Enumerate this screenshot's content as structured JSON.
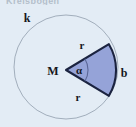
{
  "figure": {
    "cut_off_caption": "Kreisbogen",
    "background_color": "#e3ecf5",
    "circle": {
      "label": "k",
      "center_x": 66,
      "center_y": 67,
      "radius": 52,
      "stroke_color": "#9aa6b4",
      "fill": "none"
    },
    "sector": {
      "fill_color": "#95a3d8",
      "stroke_color": "#1b2340",
      "apex_x": 66,
      "apex_y": 70,
      "radius": 50,
      "start_angle_deg": -31,
      "end_angle_deg": 31
    },
    "inner_arc": {
      "radius": 22,
      "stroke_color": "#5b6797"
    },
    "labels": {
      "circle": "k",
      "center": "M",
      "angle": "α",
      "radius_top": "r",
      "radius_bottom": "r",
      "arc": "b"
    }
  }
}
